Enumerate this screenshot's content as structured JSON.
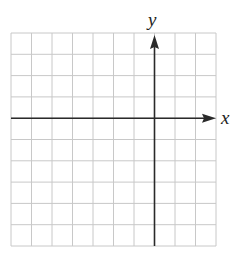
{
  "diagram": {
    "type": "coordinate-grid",
    "grid": {
      "columns": 10,
      "rows": 10,
      "line_color": "#c8c8c8",
      "axis_color": "#2a2a2a"
    },
    "axes": {
      "x_label": "x",
      "y_label": "y",
      "y_axis_column_index": 7,
      "x_axis_row_index": 4
    }
  }
}
